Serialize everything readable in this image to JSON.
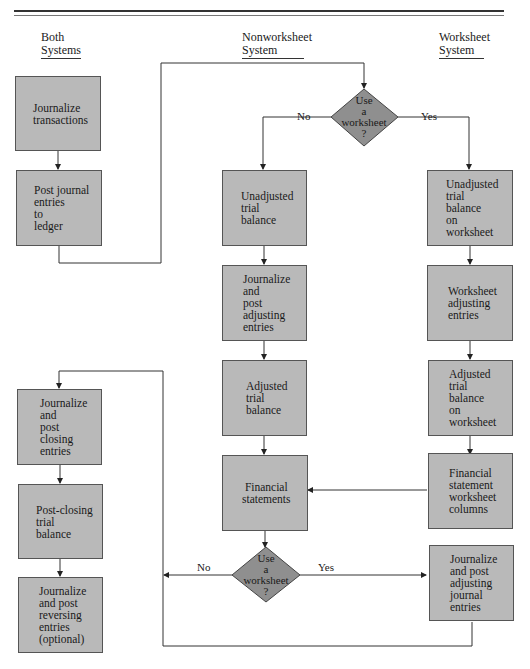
{
  "columns": {
    "both": {
      "line1": "Both",
      "line2": "Systems"
    },
    "nonworksheet": {
      "line1": "Nonworksheet",
      "line2": "System"
    },
    "worksheet": {
      "line1": "Worksheet",
      "line2": "System"
    }
  },
  "both_steps": [
    {
      "label": "Journalize\ntransactions"
    },
    {
      "label": "Post journal\nentries\nto\nledger"
    }
  ],
  "decision_top": {
    "label": "Use\na\nworksheet\n?",
    "no": "No",
    "yes": "Yes"
  },
  "nonworksheet_steps": [
    {
      "label": "Unadjusted\ntrial\nbalance"
    },
    {
      "label": "Journalize\nand\npost\nadjusting\nentries"
    },
    {
      "label": "Adjusted\ntrial\nbalance"
    },
    {
      "label": "Financial\nstatements"
    }
  ],
  "worksheet_steps": [
    {
      "label": "Unadjusted\ntrial\nbalance\non\nworksheet"
    },
    {
      "label": "Worksheet\nadjusting\nentries"
    },
    {
      "label": "Adjusted\ntrial\nbalance\non\nworksheet"
    },
    {
      "label": "Financial\nstatement\nworksheet\ncolumns"
    },
    {
      "label": "Journalize\nand post\nadjusting\njournal\nentries"
    }
  ],
  "decision_bottom": {
    "label": "Use\na\nworksheet\n?",
    "no": "No",
    "yes": "Yes"
  },
  "closing_steps": [
    {
      "label": "Journalize\nand\npost\nclosing\nentries"
    },
    {
      "label": "Post-closing\ntrial\nbalance"
    },
    {
      "label": "Journalize\nand post\nreversing\nentries\n(optional)"
    }
  ],
  "colors": {
    "box_fill": "#b9b9b9",
    "diamond_fill": "#8f8f8f",
    "line": "#333333"
  }
}
